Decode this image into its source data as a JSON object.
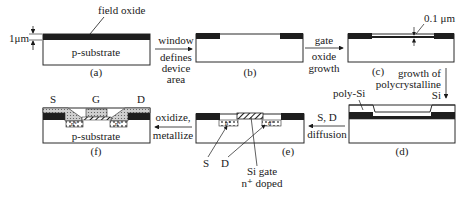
{
  "diagram": {
    "colors": {
      "oxide": "#1e1e1e",
      "substrate": "#ffffff",
      "outline": "#2a2a2a",
      "polysilicon": "#d8d8d8",
      "text": "#1a1a1a"
    },
    "panels": [
      {
        "id": "a",
        "label": "(a)",
        "substrate_label": "p-substrate",
        "callout": "field oxide",
        "dimension": "1μm"
      },
      {
        "id": "b",
        "label": "(b)"
      },
      {
        "id": "c",
        "label": "(c)",
        "dimension": "0.1 μm"
      },
      {
        "id": "d",
        "label": "(d)",
        "callout": "poly-Si"
      },
      {
        "id": "e",
        "label": "(e)",
        "callouts": [
          "S",
          "D",
          "Si gate",
          "n⁺ doped"
        ],
        "doped_region": "n⁺"
      },
      {
        "id": "f",
        "label": "(f)",
        "substrate_label": "p-substrate",
        "terminals": [
          "S",
          "G",
          "D"
        ],
        "doped_region": "n⁺"
      }
    ],
    "steps": [
      {
        "from": "a",
        "to": "b",
        "lines": [
          "window",
          "defines",
          "device",
          "area"
        ]
      },
      {
        "from": "b",
        "to": "c",
        "lines": [
          "gate",
          "oxide",
          "growth"
        ]
      },
      {
        "from": "c",
        "to": "d",
        "lines": [
          "growth of",
          "polycrystalline",
          "Si"
        ]
      },
      {
        "from": "d",
        "to": "e",
        "lines": [
          "S, D",
          "diffusion"
        ]
      },
      {
        "from": "e",
        "to": "f",
        "lines": [
          "oxidize,",
          "metallize"
        ]
      }
    ]
  }
}
